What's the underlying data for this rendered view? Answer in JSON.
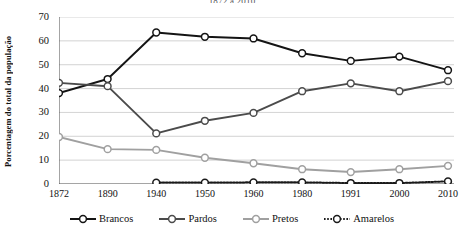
{
  "chart_data": {
    "type": "line",
    "title": "1872 a 2010",
    "xlabel": "",
    "ylabel": "Porcentagem do total da população",
    "x": [
      "1872",
      "1890",
      "1940",
      "1950",
      "1960",
      "1980",
      "1991",
      "2000",
      "2010"
    ],
    "ylim": [
      0,
      70
    ],
    "yticks": [
      0,
      10,
      20,
      30,
      40,
      50,
      60,
      70
    ],
    "grid": true,
    "legend_position": "bottom",
    "series": [
      {
        "name": "Brancos",
        "color": "#141414",
        "style": "solid",
        "values": [
          38.1,
          44.0,
          63.5,
          61.7,
          61.0,
          54.8,
          51.6,
          53.4,
          47.7
        ]
      },
      {
        "name": "Pardos",
        "color": "#4b4b4b",
        "style": "solid",
        "values": [
          42.4,
          41.0,
          21.2,
          26.5,
          29.8,
          38.9,
          42.2,
          38.9,
          43.1
        ]
      },
      {
        "name": "Pretos",
        "color": "#a0a0a0",
        "style": "solid",
        "values": [
          19.7,
          14.6,
          14.3,
          11.0,
          8.7,
          6.2,
          5.0,
          6.2,
          7.6
        ]
      },
      {
        "name": "Amarelos",
        "color": "#1a1a1a",
        "style": "dotted",
        "values": [
          null,
          null,
          0.6,
          0.6,
          0.7,
          0.7,
          0.4,
          0.4,
          1.1
        ]
      }
    ]
  },
  "legend": {
    "items": [
      {
        "label": "Brancos"
      },
      {
        "label": "Pardos"
      },
      {
        "label": "Pretos"
      },
      {
        "label": "Amarelos"
      }
    ]
  }
}
